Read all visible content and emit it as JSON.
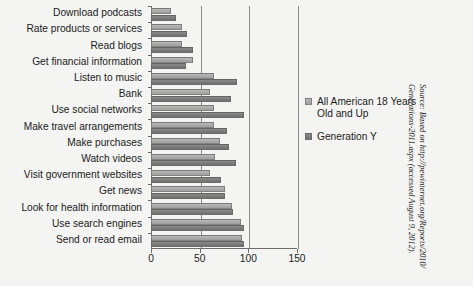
{
  "chart_data": {
    "type": "bar",
    "orientation": "horizontal",
    "title": "",
    "xlabel": "",
    "ylabel": "",
    "xlim": [
      0,
      150
    ],
    "xticks": [
      0,
      50,
      100,
      150
    ],
    "grid": true,
    "grid_axis": "x",
    "legend_position": "right",
    "categories": [
      "Download podcasts",
      "Rate products or services",
      "Read blogs",
      "Get financial information",
      "Listen to music",
      "Bank",
      "Use social networks",
      "Make travel arrangements",
      "Make purchases",
      "Watch videos",
      "Visit government websites",
      "Get news",
      "Look for health information",
      "Use search engines",
      "Send or read email"
    ],
    "series": [
      {
        "name": "All American 18 Years Old and Up",
        "color": "#aaaaaa",
        "values": [
          21,
          32,
          32,
          43,
          65,
          61,
          65,
          65,
          71,
          66,
          61,
          76,
          83,
          92,
          94
        ]
      },
      {
        "name": "Generation Y",
        "color": "#7d7d7d",
        "values": [
          26,
          37,
          43,
          36,
          88,
          82,
          96,
          78,
          80,
          87,
          72,
          76,
          84,
          96,
          96
        ]
      }
    ]
  },
  "legend": {
    "items": [
      {
        "label": "All American 18 Years Old and Up",
        "swatch": "light"
      },
      {
        "label": "Generation Y",
        "swatch": "dark"
      }
    ]
  },
  "source": {
    "note": "Source: Based on http://pewinternet.org/Reports/2010/\nGenerations-2011.aspx  (accessed August 9, 2012)."
  },
  "colors": {
    "series_light": "#aaaaaa",
    "series_dark": "#7d7d7d",
    "axis": "#6d6d6d",
    "background": "#f4f4f2",
    "text": "#1b1b1b"
  }
}
